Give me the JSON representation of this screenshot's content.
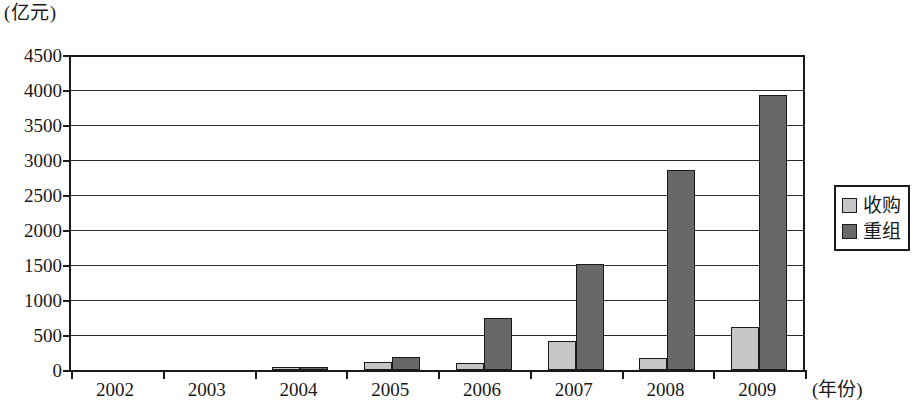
{
  "chart_data": {
    "type": "bar",
    "title": "",
    "subtitle": "",
    "unit_label": "(亿元)",
    "ylabel": "",
    "xlabel": "(年份)",
    "categories": [
      "2002",
      "2003",
      "2004",
      "2005",
      "2006",
      "2007",
      "2008",
      "2009"
    ],
    "series": [
      {
        "name": "收购",
        "color": "#c6c6c6",
        "values": [
          0,
          0,
          50,
          110,
          100,
          420,
          170,
          610
        ]
      },
      {
        "name": "重组",
        "color": "#686868",
        "values": [
          0,
          0,
          50,
          180,
          750,
          1510,
          2860,
          3930
        ]
      }
    ],
    "ylim": [
      0,
      4500
    ],
    "yticks": [
      4500,
      4000,
      3500,
      3000,
      2500,
      2000,
      1500,
      1000,
      500,
      0
    ],
    "ytick_labels": [
      "4500",
      "4000",
      "3500",
      "3000",
      "2500",
      "2000",
      "1500",
      "1000",
      "500",
      "0"
    ],
    "grid": true,
    "grid_axis": "y",
    "legend_position": "right",
    "legend_entries": [
      "收购",
      "重组"
    ]
  }
}
